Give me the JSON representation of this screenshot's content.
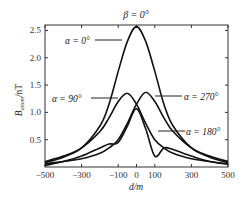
{
  "chart_data": {
    "type": "line",
    "title": "β = 0°",
    "xlabel": "d/m",
    "ylabel": "B_anom/nT",
    "xlim": [
      -500,
      500
    ],
    "ylim": [
      0,
      2.6
    ],
    "xticks": [
      -500,
      -300,
      -100,
      0,
      100,
      300,
      500
    ],
    "yticks": [
      0.5,
      1.0,
      1.5,
      2.0,
      2.5
    ],
    "grid": false,
    "legend_position": "inline annotations",
    "x": [
      -500,
      -400,
      -300,
      -200,
      -150,
      -100,
      -50,
      0,
      50,
      100,
      150,
      200,
      300,
      400,
      500
    ],
    "series": [
      {
        "name": "α = 0°",
        "values": [
          0.08,
          0.18,
          0.35,
          0.75,
          1.15,
          1.75,
          2.3,
          2.57,
          2.3,
          1.75,
          1.15,
          0.75,
          0.35,
          0.18,
          0.08
        ]
      },
      {
        "name": "α = 90°",
        "values": [
          0.1,
          0.2,
          0.35,
          0.65,
          0.9,
          1.2,
          1.35,
          1.15,
          0.8,
          0.5,
          0.35,
          0.25,
          0.15,
          0.1,
          0.06
        ]
      },
      {
        "name": "α = 270°",
        "values": [
          0.06,
          0.1,
          0.15,
          0.25,
          0.35,
          0.5,
          0.8,
          1.15,
          1.37,
          1.2,
          0.9,
          0.65,
          0.35,
          0.2,
          0.1
        ]
      },
      {
        "name": "α = 180°",
        "values": [
          0.03,
          0.1,
          0.2,
          0.35,
          0.42,
          0.45,
          0.75,
          1.07,
          0.7,
          0.2,
          0.35,
          0.32,
          0.2,
          0.1,
          0.05
        ]
      }
    ],
    "annotations": [
      {
        "text": "α = 0°",
        "target_series": "α = 0°"
      },
      {
        "text": "α = 90°",
        "target_series": "α = 90°"
      },
      {
        "text": "α = 270°",
        "target_series": "α = 270°"
      },
      {
        "text": "α = 180°",
        "target_series": "α = 180°"
      }
    ]
  },
  "labels": {
    "title": "β = 0°",
    "xlabel": "d/m",
    "ylabel_main": "B",
    "ylabel_sub": "anom",
    "ylabel_unit": "/nT",
    "ann_0": "α = 0°",
    "ann_90": "α = 90°",
    "ann_270": "α = 270°",
    "ann_180": "α = 180°"
  }
}
